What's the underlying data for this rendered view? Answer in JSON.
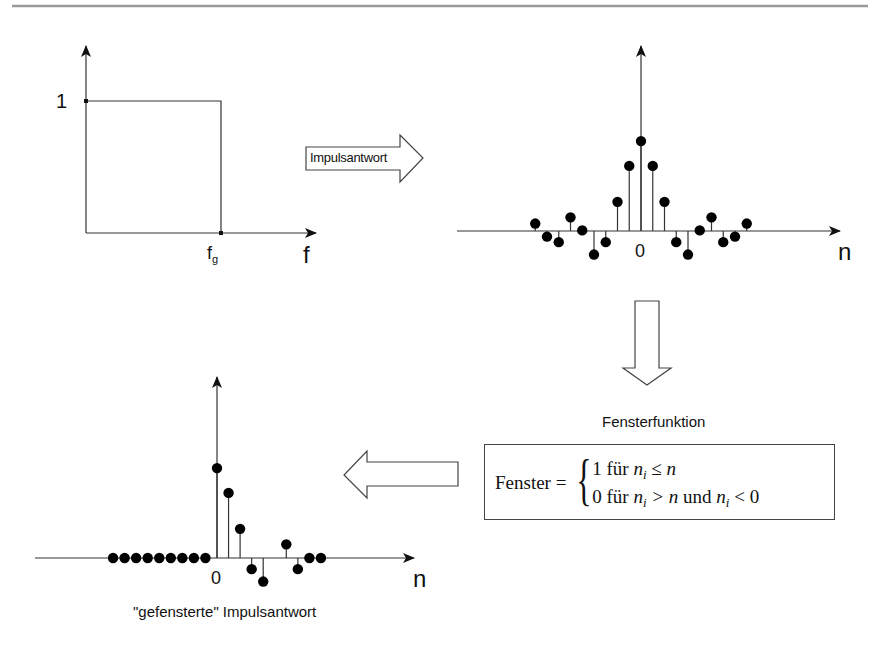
{
  "diagram": {
    "panel_frequency_response": {
      "y_tick_label": "1",
      "x_tick_label_base": "f",
      "x_tick_label_sub": "g",
      "x_axis_label": "f"
    },
    "arrow_right": {
      "label": "Impulsantwort"
    },
    "panel_impulse_response": {
      "x_tick_label": "0",
      "x_axis_label": "n"
    },
    "window_function": {
      "heading": "Fensterfunktion",
      "lhs": "Fenster =",
      "case1_value": "1",
      "case1_word": "für",
      "case1_condition": "n",
      "case1_sub": "i",
      "case1_rel": "≤ n",
      "case2_value": "0",
      "case2_word": "für",
      "case2_condition": "n",
      "case2_sub": "i",
      "case2_rel": "> n",
      "case2_and": "und",
      "case2_condition2": "n",
      "case2_sub2": "i",
      "case2_rel2": "< 0"
    },
    "panel_windowed": {
      "x_tick_label": "0",
      "x_axis_label": "n",
      "caption": "\"gefensterte\" Impulsantwort"
    },
    "colors": {
      "line": "#333333",
      "dot": "#000000",
      "rule": "#9a9a9a"
    }
  },
  "chart_data": [
    {
      "type": "line",
      "title": "Idealer Tiefpass (Frequenzgang)",
      "xlabel": "f",
      "ylabel": "",
      "x": [
        0,
        "f_g",
        "f_g"
      ],
      "y": [
        1,
        1,
        0
      ],
      "y_ticks": [
        "1"
      ],
      "x_ticks": [
        "f_g"
      ]
    },
    {
      "type": "stem",
      "title": "Impulsantwort",
      "xlabel": "n",
      "x": [
        -9,
        -8,
        -7,
        -6,
        -5,
        -4,
        -3,
        -2,
        -1,
        0,
        1,
        2,
        3,
        4,
        5,
        6,
        7,
        8,
        9
      ],
      "values": [
        0.12,
        -0.09,
        -0.18,
        0.22,
        0.01,
        -0.38,
        -0.18,
        0.47,
        1.05,
        1.45,
        1.05,
        0.47,
        -0.18,
        -0.38,
        0.01,
        0.22,
        -0.18,
        -0.09,
        0.12
      ],
      "x_ticks": [
        "0"
      ]
    },
    {
      "type": "stem",
      "title": "\"gefensterte\" Impulsantwort",
      "xlabel": "n",
      "x": [
        -9,
        -8,
        -7,
        -6,
        -5,
        -4,
        -3,
        -2,
        -1,
        0,
        1,
        2,
        3,
        4,
        6,
        7,
        8,
        9
      ],
      "values": [
        0,
        0,
        0,
        0,
        0,
        0,
        0,
        0,
        0,
        1.45,
        1.05,
        0.47,
        -0.18,
        -0.38,
        0.22,
        -0.18,
        0,
        0
      ],
      "x_ticks": [
        "0"
      ]
    }
  ]
}
